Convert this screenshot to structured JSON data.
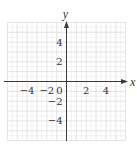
{
  "chart_data": {
    "type": "scatter",
    "title": "",
    "xlabel": "x",
    "ylabel": "y",
    "xlim": [
      -6,
      6
    ],
    "ylim": [
      -6,
      6
    ],
    "grid": true,
    "grid_step": 1,
    "x_ticks": [
      {
        "value": -4,
        "label": "−4"
      },
      {
        "value": -2,
        "label": "−2"
      },
      {
        "value": 0,
        "label": "0"
      },
      {
        "value": 2,
        "label": "2"
      },
      {
        "value": 4,
        "label": "4"
      }
    ],
    "y_ticks": [
      {
        "value": 4,
        "label": "4"
      },
      {
        "value": 2,
        "label": "2"
      },
      {
        "value": -2,
        "label": "−2"
      },
      {
        "value": -4,
        "label": "−4"
      }
    ],
    "series": [],
    "legend": null
  },
  "colors": {
    "grid": "#d9d9d9",
    "axis": "#3a3a3a",
    "text": "#333333"
  }
}
